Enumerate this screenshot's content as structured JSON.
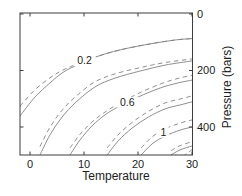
{
  "figure": {
    "background": "#ffffff",
    "frame_color": "#3c3c3c",
    "curve_color": "#828282",
    "text_color": "#1c1c1c"
  },
  "chart_data": {
    "type": "line",
    "title": "",
    "xlabel": "Temperature",
    "ylabel": "Pressure (bars)",
    "xlim": [
      -1.85,
      30
    ],
    "ylim": [
      0,
      500
    ],
    "y_inverted": true,
    "y_axis_side": "right",
    "grid": false,
    "x_ticks": [
      0,
      10,
      20,
      30
    ],
    "y_ticks": [
      0,
      200,
      400
    ],
    "contour_labels": [
      {
        "text": "0.2",
        "T": 10.1,
        "P": 166
      },
      {
        "text": "0.6",
        "T": 18.0,
        "P": 312
      },
      {
        "text": "1",
        "T": 24.7,
        "P": 419
      }
    ],
    "series": [
      {
        "name": "contour 0.2 solid",
        "level": 0.2,
        "style": "solid",
        "points": [
          [
            -1.85,
            361
          ],
          [
            0.93,
            294
          ],
          [
            3.7,
            244
          ],
          [
            5.93,
            209
          ],
          [
            8.33,
            184
          ],
          [
            12.2,
            152
          ],
          [
            16.7,
            127
          ],
          [
            22.2,
            106
          ],
          [
            26.9,
            92
          ],
          [
            30,
            87
          ]
        ]
      },
      {
        "name": "contour 0.2 dashed",
        "level": 0.2,
        "style": "dashed",
        "points": [
          [
            -1.85,
            326
          ],
          [
            0.93,
            268
          ],
          [
            3.7,
            226
          ],
          [
            5.93,
            200
          ],
          [
            8.33,
            180
          ],
          [
            12.2,
            152
          ],
          [
            16.7,
            127
          ],
          [
            22.2,
            106
          ],
          [
            26.9,
            92
          ],
          [
            30,
            87
          ]
        ]
      },
      {
        "name": "contour 0.4 solid",
        "level": 0.4,
        "style": "solid",
        "points": [
          [
            1.85,
            499
          ],
          [
            3.7,
            428
          ],
          [
            5.93,
            365
          ],
          [
            8.52,
            312
          ],
          [
            12.04,
            258
          ],
          [
            15.74,
            227
          ],
          [
            20.37,
            202
          ],
          [
            25,
            181
          ],
          [
            30,
            166
          ]
        ]
      },
      {
        "name": "contour 0.4 dashed",
        "level": 0.4,
        "style": "dashed",
        "points": [
          [
            1.85,
            469
          ],
          [
            3.7,
            401
          ],
          [
            5.93,
            341
          ],
          [
            8.52,
            291
          ],
          [
            12.04,
            240
          ],
          [
            15.74,
            212
          ],
          [
            20.37,
            190
          ],
          [
            25,
            172
          ],
          [
            30,
            159
          ]
        ]
      },
      {
        "name": "contour 0.6 solid",
        "level": 0.6,
        "style": "solid",
        "points": [
          [
            7.4,
            499
          ],
          [
            9.26,
            446
          ],
          [
            11.5,
            396
          ],
          [
            13.9,
            357
          ],
          [
            16.3,
            329
          ],
          [
            20,
            294
          ],
          [
            24.1,
            262
          ],
          [
            27.4,
            244
          ],
          [
            30,
            234
          ]
        ]
      },
      {
        "name": "contour 0.6 dashed",
        "level": 0.6,
        "style": "dashed",
        "points": [
          [
            7.4,
            474
          ],
          [
            9.26,
            426
          ],
          [
            11.5,
            382
          ],
          [
            13.9,
            347
          ],
          [
            16.3,
            319
          ],
          [
            20,
            282
          ],
          [
            24.1,
            248
          ],
          [
            27.4,
            228
          ],
          [
            30,
            217
          ]
        ]
      },
      {
        "name": "contour 0.8 solid",
        "level": 0.8,
        "style": "solid",
        "points": [
          [
            14.3,
            499
          ],
          [
            16.3,
            450
          ],
          [
            18.9,
            404
          ],
          [
            21.9,
            365
          ],
          [
            25,
            336
          ],
          [
            27.8,
            322
          ],
          [
            30,
            311
          ]
        ]
      },
      {
        "name": "contour 0.8 dashed",
        "level": 0.8,
        "style": "dashed",
        "points": [
          [
            14.3,
            474
          ],
          [
            16.3,
            428
          ],
          [
            18.9,
            384
          ],
          [
            21.9,
            345
          ],
          [
            25,
            315
          ],
          [
            27.8,
            301
          ],
          [
            30,
            290
          ]
        ]
      },
      {
        "name": "contour 1.0 solid",
        "level": 1.0,
        "style": "solid",
        "points": [
          [
            20.6,
            499
          ],
          [
            22.6,
            460
          ],
          [
            25,
            432
          ],
          [
            27.8,
            411
          ],
          [
            30,
            400
          ]
        ]
      },
      {
        "name": "contour 1.0 dashed",
        "level": 1.0,
        "style": "dashed",
        "points": [
          [
            20.6,
            474
          ],
          [
            22.6,
            435
          ],
          [
            25,
            407
          ],
          [
            27.8,
            386
          ],
          [
            30,
            375
          ]
        ]
      },
      {
        "name": "contour 1.2 solid",
        "level": 1.2,
        "style": "solid",
        "points": [
          [
            26.1,
            499
          ],
          [
            27.8,
            481
          ],
          [
            30,
            467
          ]
        ]
      },
      {
        "name": "contour 1.2 dashed",
        "level": 1.2,
        "style": "dashed",
        "points": [
          [
            26.1,
            484
          ],
          [
            27.8,
            466
          ],
          [
            30,
            452
          ]
        ]
      },
      {
        "name": "contour 1.4 dashed",
        "level": 1.4,
        "style": "dashed",
        "points": [
          [
            28.3,
            505
          ],
          [
            30,
            480
          ]
        ]
      }
    ]
  }
}
